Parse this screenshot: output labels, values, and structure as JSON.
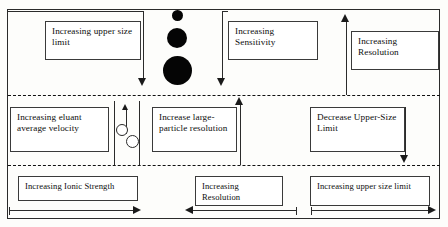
{
  "diagram": {
    "background": "#fdfdfb",
    "line_color": "#2b2b2b",
    "particle_color": "#050505"
  },
  "bands": [
    {
      "name": "top-band",
      "label": "upper band"
    },
    {
      "name": "middle-band",
      "label": "middle band"
    },
    {
      "name": "bottom-band",
      "label": "lower band"
    }
  ],
  "boxes": {
    "increasing_upper_size_limit": "Increasing upper size limit",
    "increasing_sensitivity": "Increasing Sensitivity",
    "increasing_resolution_top": "Increasing Resolution",
    "increasing_eluant_average_velocity": "Increasing eluant average velocity",
    "increase_large_particle_resolution": "Increase large-particle resolution",
    "decrease_upper_size_limit": "Decrease Upper-Size Limit",
    "increasing_ionic_strength": "Increasing Ionic Strength",
    "increasing_resolution_bottom": "Increasing Resolution",
    "increasing_upper_size_limit_bottom": "Increasing upper size limit"
  },
  "particles": {
    "large_stack": [
      {
        "name": "particle-small",
        "diameter": 11
      },
      {
        "name": "particle-medium",
        "diameter": 20
      },
      {
        "name": "particle-large",
        "diameter": 29
      }
    ],
    "channel_particles": [
      {
        "name": "hollow-particle-upper",
        "diameter": 10
      },
      {
        "name": "hollow-particle-lower",
        "diameter": 11
      }
    ]
  },
  "arrows": [
    {
      "name": "arrow-down-upper-size-limit",
      "direction": "down"
    },
    {
      "name": "arrow-down-sensitivity",
      "direction": "down"
    },
    {
      "name": "arrow-up-resolution-top",
      "direction": "up"
    },
    {
      "name": "arrow-up-channel-flow",
      "direction": "up"
    },
    {
      "name": "arrow-up-large-particle-resolution",
      "direction": "up"
    },
    {
      "name": "arrow-down-decrease-upper-size-limit",
      "direction": "down"
    },
    {
      "name": "arrow-right-ionic-strength",
      "direction": "right"
    },
    {
      "name": "arrow-left-resolution-bottom",
      "direction": "left"
    },
    {
      "name": "arrow-right-upper-size-limit-bottom",
      "direction": "right"
    }
  ]
}
